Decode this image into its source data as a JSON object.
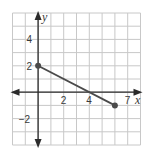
{
  "chart_data": {
    "type": "line",
    "title": "",
    "xlabel": "x",
    "ylabel": "y",
    "xlim": [
      -2,
      8
    ],
    "ylim": [
      -4,
      6
    ],
    "grid": true,
    "x_ticks": [
      {
        "value": 2,
        "label": "2"
      },
      {
        "value": 4,
        "label": "4"
      },
      {
        "value": 7,
        "label": "7"
      }
    ],
    "y_ticks": [
      {
        "value": 4,
        "label": "4"
      },
      {
        "value": 2,
        "label": "2"
      },
      {
        "value": -2,
        "label": "−2"
      }
    ],
    "series": [
      {
        "name": "segment",
        "points": [
          {
            "x": 0,
            "y": 2
          },
          {
            "x": 6,
            "y": -1
          }
        ],
        "color": "#4a4a4a",
        "endpoint_markers": true
      }
    ]
  },
  "colors": {
    "grid": "#c8c8c8",
    "axis": "#2b2b2b",
    "line": "#4a4a4a"
  }
}
